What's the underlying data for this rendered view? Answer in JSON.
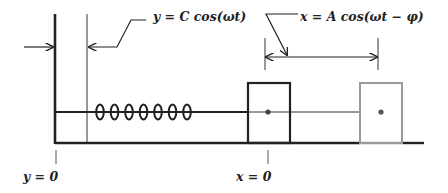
{
  "diagram": {
    "labels": {
      "base_motion": "y = C cos(ωt)",
      "mass_motion": "x = A cos(ωt − φ)",
      "base_origin": "y = 0",
      "mass_origin": "x = 0"
    },
    "elements": {
      "wall": "moving base wall",
      "spring": "coil spring",
      "coil_count": 7,
      "mass_equilibrium": "mass at equilibrium position",
      "mass_displaced": "mass at displaced position (gray)",
      "ground": "floor"
    },
    "colors": {
      "ink": "#222222",
      "displaced_mass": "#9a9a9a",
      "background": "#ffffff"
    }
  }
}
